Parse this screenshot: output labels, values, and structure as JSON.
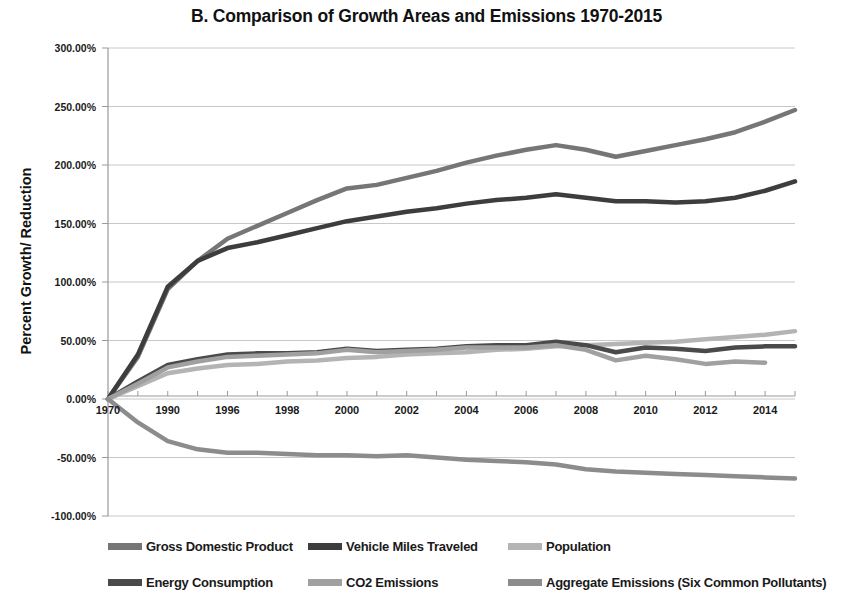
{
  "chart_data": {
    "type": "line",
    "title": "B. Comparison of Growth Areas and Emissions 1970-2015",
    "xlabel": "",
    "ylabel": "Percent Growth/ Reduction",
    "ylim": [
      -100,
      300
    ],
    "y_tick_step": 50,
    "y_ticks": [
      "-100.00%",
      "-50.00%",
      "0.00%",
      "50.00%",
      "100.00%",
      "150.00%",
      "200.00%",
      "250.00%",
      "300.00%"
    ],
    "grid": true,
    "legend_position": "bottom",
    "x": [
      1970,
      1980,
      1990,
      1994,
      1996,
      1997,
      1998,
      1999,
      2000,
      2001,
      2002,
      2003,
      2004,
      2005,
      2006,
      2007,
      2008,
      2009,
      2010,
      2011,
      2012,
      2013,
      2014,
      2015
    ],
    "x_tick_labels": [
      "1970",
      "",
      "1990",
      "",
      "1996",
      "",
      "1998",
      "",
      "2000",
      "",
      "2002",
      "",
      "2004",
      "",
      "2006",
      "",
      "2008",
      "",
      "2010",
      "",
      "2012",
      "",
      "2014",
      ""
    ],
    "x_labels_visible": [
      "1970",
      "1990",
      "1996",
      "1998",
      "2000",
      "2002",
      "2004",
      "2006",
      "2008",
      "2010",
      "2012",
      "2014"
    ],
    "series": [
      {
        "name": "Gross Domestic Product",
        "color": "#767676",
        "width": 4.5,
        "values": [
          0,
          36,
          94,
          118,
          137,
          148,
          159,
          170,
          180,
          183,
          189,
          195,
          202,
          208,
          213,
          217,
          213,
          207,
          212,
          217,
          222,
          228,
          237,
          247
        ]
      },
      {
        "name": "Vehicle Miles Traveled",
        "color": "#3d3d3d",
        "width": 4.5,
        "values": [
          0,
          38,
          96,
          118,
          129,
          134,
          140,
          146,
          152,
          156,
          160,
          163,
          167,
          170,
          172,
          175,
          172,
          169,
          169,
          168,
          169,
          172,
          178,
          186
        ]
      },
      {
        "name": "Population",
        "color": "#b4b4b4",
        "width": 4.5,
        "values": [
          0,
          11,
          22,
          26,
          29,
          30,
          32,
          33,
          35,
          36,
          38,
          39,
          40,
          42,
          43,
          45,
          46,
          47,
          48,
          49,
          51,
          53,
          55,
          58
        ]
      },
      {
        "name": "Energy Consumption",
        "color": "#4a4a4a",
        "width": 4.5,
        "values": [
          0,
          15,
          29,
          34,
          38,
          39,
          39,
          40,
          43,
          41,
          42,
          43,
          45,
          46,
          46,
          49,
          46,
          40,
          44,
          43,
          41,
          44,
          45,
          45
        ]
      },
      {
        "name": "CO2 Emissions",
        "color": "#a0a0a0",
        "width": 4.5,
        "values": [
          0,
          13,
          27,
          32,
          36,
          37,
          38,
          39,
          42,
          40,
          41,
          42,
          44,
          44,
          44,
          46,
          42,
          33,
          37,
          34,
          30,
          32,
          31,
          null
        ]
      },
      {
        "name": "Aggregate Emissions (Six Common Pollutants)",
        "color": "#8c8c8c",
        "width": 4.5,
        "values": [
          0,
          -20,
          -36,
          -43,
          -46,
          -46,
          -47,
          -48,
          -48,
          -49,
          -48,
          -50,
          -52,
          -53,
          -54,
          -56,
          -60,
          -62,
          -63,
          -64,
          -65,
          -66,
          -67,
          -68
        ]
      }
    ]
  },
  "legend": {
    "rows": [
      [
        {
          "label": "Gross Domestic Product",
          "color": "#767676"
        },
        {
          "label": "Vehicle Miles Traveled",
          "color": "#3d3d3d"
        },
        {
          "label": "Population",
          "color": "#b4b4b4"
        }
      ],
      [
        {
          "label": "Energy Consumption",
          "color": "#4a4a4a"
        },
        {
          "label": "CO2 Emissions",
          "color": "#a0a0a0"
        },
        {
          "label": "Aggregate Emissions (Six Common Pollutants)",
          "color": "#8c8c8c"
        }
      ]
    ]
  }
}
